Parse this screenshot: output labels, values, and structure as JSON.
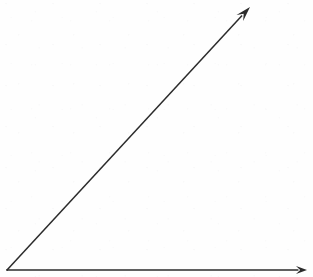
{
  "figure": {
    "kind": "geometry-diagram",
    "canvas": {
      "width": 313,
      "height": 277
    },
    "background_color": "#fefefe",
    "stroke_color": "#2b2b2b",
    "stroke_width": 1.5,
    "vertex": {
      "x": 7,
      "y": 270
    },
    "rays": [
      {
        "name": "horizontal-ray",
        "from": {
          "x": 7,
          "y": 270
        },
        "to": {
          "x": 307,
          "y": 270
        },
        "arrow": "end",
        "arrow_tip": {
          "x": 307,
          "y": 270
        },
        "arrow_length": 11,
        "arrow_width": 8,
        "angle_degrees": 0
      },
      {
        "name": "diagonal-ray",
        "from": {
          "x": 7,
          "y": 270
        },
        "to": {
          "x": 250,
          "y": 7
        },
        "arrow": "end",
        "arrow_tip": {
          "x": 250,
          "y": 7
        },
        "arrow_length": 15,
        "arrow_width": 9,
        "angle_degrees": 47.3
      }
    ],
    "angle_between_rays_degrees": 47.3,
    "labels": []
  }
}
